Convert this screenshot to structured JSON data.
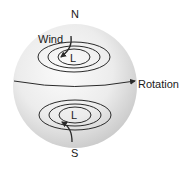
{
  "diagram": {
    "labels": {
      "north": "N",
      "south": "S",
      "wind": "Wind",
      "rotation": "Rotation",
      "low_north": "L",
      "low_south": "L"
    },
    "colors": {
      "sphere_light": "#f7f7f7",
      "sphere_dark": "#c8c8c8",
      "lines": "#2a2a2a",
      "text": "#1a1a1a"
    }
  }
}
